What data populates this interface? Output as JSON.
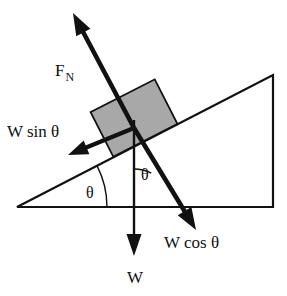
{
  "figure": {
    "type": "physics-free-body-diagram",
    "canvas": {
      "width": 287,
      "height": 296,
      "background": "#ffffff"
    }
  },
  "colors": {
    "ink": "#111111",
    "block_fill": "#a8a8a8",
    "block_stroke": "#111111",
    "background": "#ffffff"
  },
  "labels": {
    "normal_force": "F",
    "normal_force_subscript": "N",
    "along_incline": "W sin θ",
    "perpendicular": "W cos θ",
    "weight": "W",
    "angle_base": "θ",
    "angle_upper": "θ"
  },
  "geometry": {
    "incline_angle_deg": 27,
    "triangle": {
      "left_apex": [
        17,
        207
      ],
      "top_right": [
        273,
        75
      ],
      "bottom_right": [
        273,
        207
      ],
      "base_y": 207,
      "stroke_width": 2.2
    },
    "block": {
      "center": [
        134,
        118
      ],
      "width": 72,
      "height": 50,
      "rotation_deg": 27
    },
    "origin": [
      134,
      128
    ]
  },
  "vectors": [
    {
      "name": "normal-force",
      "label_key": "normal_force",
      "from": [
        134,
        128
      ],
      "to": [
        73,
        13
      ],
      "shaft_width": 4.6,
      "head_length": 22,
      "head_width": 16,
      "label_pos": [
        55,
        76
      ]
    },
    {
      "name": "weight-component-along-incline",
      "label_key": "along_incline",
      "from": [
        134,
        128
      ],
      "to": [
        68,
        155
      ],
      "shaft_width": 4.2,
      "head_length": 20,
      "head_width": 15,
      "label_pos": [
        7,
        137
      ]
    },
    {
      "name": "weight-component-perpendicular",
      "label_key": "perpendicular",
      "from": [
        134,
        128
      ],
      "to": [
        196,
        230
      ],
      "shaft_width": 4.6,
      "head_length": 22,
      "head_width": 16,
      "label_pos": [
        164,
        248
      ]
    },
    {
      "name": "weight",
      "label_key": "weight",
      "from": [
        134,
        120
      ],
      "to": [
        134,
        256
      ],
      "shaft_width": 2.4,
      "head_length": 22,
      "head_width": 15,
      "label_pos": [
        127,
        283
      ]
    }
  ],
  "angle_arcs": [
    {
      "name": "base-angle",
      "vertex": [
        17,
        207
      ],
      "radius": 90,
      "start_deg": 0,
      "end_deg": -27,
      "label_pos": [
        86,
        198
      ]
    },
    {
      "name": "upper-angle",
      "vertex": [
        134,
        207
      ],
      "radius": 38,
      "start_deg": -90,
      "end_deg": -63,
      "label_pos": [
        141,
        180
      ]
    }
  ],
  "chart_data": {
    "type": "diagram",
    "annotations": [
      {
        "text": "F_N",
        "meaning": "normal force, perpendicular to and away from the incline surface"
      },
      {
        "text": "W sin θ",
        "meaning": "component of weight directed down the slope"
      },
      {
        "text": "W cos θ",
        "meaning": "component of weight perpendicular into the incline surface"
      },
      {
        "text": "W",
        "meaning": "total weight of the block, vertically downward"
      },
      {
        "text": "θ",
        "meaning": "incline angle at the base of the wedge"
      },
      {
        "text": "θ",
        "meaning": "angle between the vertical weight vector and the perpendicular component"
      }
    ],
    "incline_angle_deg": 27
  }
}
